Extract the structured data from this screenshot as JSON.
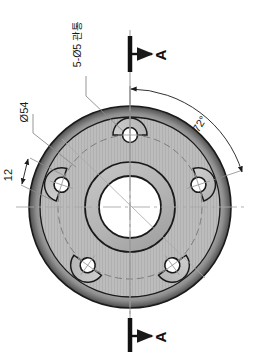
{
  "drawing": {
    "view_type": "plan-view",
    "part": "flange-plate",
    "background_color": "#ffffff",
    "line_color": "#1a1a1a",
    "body_fill": "#b8b8b8",
    "bore_fill": "#ffffff",
    "pad_fill": "#c4c4c4",
    "rim_shadow": "#6e6e6e",
    "centerline_color": "#9a9a9a"
  },
  "annotations": {
    "hole_note": "5-Ø5 관통",
    "bolt_circle_dim": "Ø54",
    "pad_width_dim": "12",
    "angular_dim": "72°",
    "section_letter_top": "A",
    "section_letter_bottom": "A"
  },
  "geometry": {
    "center": {
      "x": 130,
      "y": 207
    },
    "outer_radius": 101,
    "bolt_circle_radius": 72,
    "boss_radius": 45,
    "bore_radius": 31,
    "pad_radius": 17,
    "hole_radius": 7.5,
    "hole_count": 5,
    "hole_angles_deg": [
      -90,
      -18,
      54,
      126,
      198
    ],
    "section_line_x": 130
  },
  "section_markers": [
    {
      "name": "top",
      "bar_x": 130,
      "bar_y1": 36,
      "bar_y2": 72,
      "arrow_y": 54,
      "letter_x": 160,
      "letter_y": 60
    },
    {
      "name": "bottom",
      "bar_x": 130,
      "bar_y1": 318,
      "bar_y2": 352,
      "arrow_y": 336,
      "letter_x": 160,
      "letter_y": 342
    }
  ]
}
